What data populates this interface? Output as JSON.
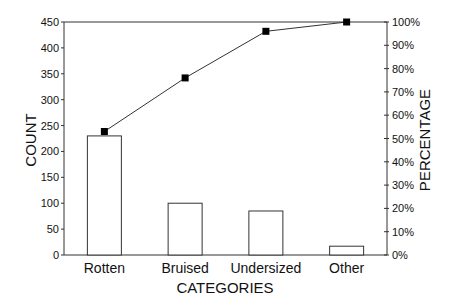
{
  "chart_data": {
    "type": "bar",
    "subtype": "pareto",
    "title": "",
    "xlabel": "CATEGORIES",
    "ylabel": "COUNT",
    "y2label": "PERCENTAGE",
    "categories": [
      "Rotten",
      "Bruised",
      "Undersized",
      "Other"
    ],
    "series": [
      {
        "name": "Count",
        "type": "bar",
        "axis": "left",
        "values": [
          230,
          100,
          85,
          17
        ]
      },
      {
        "name": "Cumulative Percentage",
        "type": "line",
        "axis": "right",
        "marker": "square",
        "values": [
          53,
          76,
          96,
          100
        ]
      }
    ],
    "ylim": [
      0,
      450
    ],
    "y2lim": [
      0,
      100
    ],
    "yticks": [
      0,
      50,
      100,
      150,
      200,
      250,
      300,
      350,
      400,
      450
    ],
    "y2ticks": [
      "0%",
      "10%",
      "20%",
      "30%",
      "40%",
      "50%",
      "60%",
      "70%",
      "80%",
      "90%",
      "100%"
    ],
    "grid": false,
    "legend": "none"
  }
}
